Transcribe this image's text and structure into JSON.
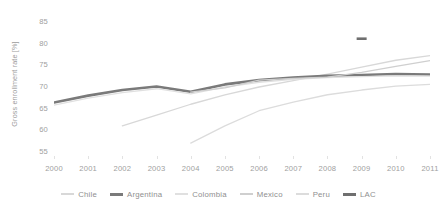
{
  "chart_data": {
    "type": "line",
    "title": "",
    "xlabel": "",
    "ylabel": "Gross enrollment rate [%]",
    "x": [
      2000,
      2001,
      2002,
      2003,
      2004,
      2005,
      2006,
      2007,
      2008,
      2009,
      2010,
      2011
    ],
    "xticklabels": [
      "2000",
      "2001",
      "2002",
      "2003",
      "2004",
      "2005",
      "2006",
      "2007",
      "2008",
      "2009",
      "2010",
      "2011"
    ],
    "yticks": [
      55,
      60,
      65,
      70,
      75,
      80,
      85
    ],
    "yticklabels": [
      "55",
      "60",
      "65",
      "70",
      "75",
      "80",
      "85"
    ],
    "xlim": [
      2000,
      2011
    ],
    "ylim": [
      54,
      86
    ],
    "grid": false,
    "legend_position": "bottom",
    "series": [
      {
        "name": "Chile",
        "color": "#d8d8d8",
        "width": 1.3,
        "x": [
          2002,
          2003,
          2004,
          2005,
          2006,
          2007,
          2008,
          2009,
          2010,
          2011
        ],
        "values": [
          61.0,
          63.5,
          66.0,
          68.2,
          70.0,
          71.5,
          73.0,
          74.6,
          76.2,
          77.3
        ]
      },
      {
        "name": "Argentina",
        "color": "#7a7a7a",
        "width": 2.6,
        "x": [
          2000,
          2001,
          2002,
          2003,
          2004,
          2005,
          2006,
          2007,
          2008,
          2009,
          2010,
          2011
        ],
        "values": [
          66.4,
          68.0,
          69.3,
          70.1,
          68.9,
          70.6,
          71.6,
          72.2,
          72.6,
          72.8,
          73.0,
          72.9
        ]
      },
      {
        "name": "Colombia",
        "color": "#e0e0e0",
        "width": 1.3,
        "x": [
          2000,
          2001,
          2002,
          2003,
          2004,
          2005,
          2006,
          2007,
          2008,
          2009,
          2010,
          2011
        ],
        "values": [
          65.8,
          67.4,
          68.7,
          69.6,
          68.4,
          70.0,
          71.1,
          71.8,
          72.2,
          72.4,
          72.6,
          72.5
        ]
      },
      {
        "name": "Mexico",
        "color": "#cfcfcf",
        "width": 1.3,
        "x": [
          2004,
          2005,
          2006,
          2007,
          2008,
          2009,
          2010,
          2011
        ],
        "values": [
          68.8,
          69.8,
          71.6,
          72.0,
          72.3,
          73.4,
          74.8,
          76.1
        ]
      },
      {
        "name": "Peru",
        "color": "#dcdcdc",
        "width": 1.3,
        "x": [
          2004,
          2005,
          2006,
          2007,
          2008,
          2009,
          2010,
          2011
        ],
        "values": [
          57.0,
          61.0,
          64.5,
          66.5,
          68.2,
          69.3,
          70.2,
          70.6
        ]
      },
      {
        "name": "LAC",
        "color": "#6f6f6f",
        "width": 2.6,
        "x": [
          2009
        ],
        "values": [
          81.2
        ],
        "segment_only": true
      }
    ]
  }
}
